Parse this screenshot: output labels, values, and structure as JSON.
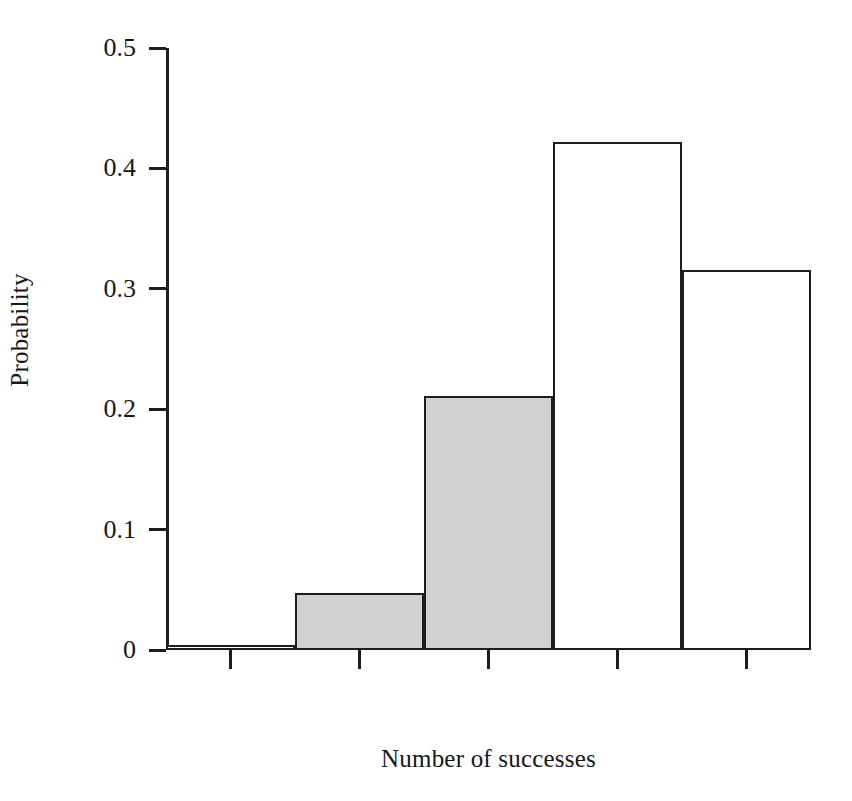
{
  "chart_data": {
    "type": "bar",
    "title": "",
    "subtitle": "",
    "xlabel": "Number of successes",
    "ylabel": "Probability",
    "categories": [
      "0",
      "1",
      "2",
      "3",
      "4"
    ],
    "values": [
      0.004,
      0.047,
      0.211,
      0.422,
      0.316
    ],
    "bar_fill": [
      "white",
      "shaded",
      "shaded",
      "white",
      "white"
    ],
    "xlim": [
      -0.5,
      4.5
    ],
    "ylim": [
      0,
      0.5
    ],
    "xticks": [
      "0",
      "1",
      "2",
      "3",
      "4"
    ],
    "yticks": [
      "0",
      "0.1",
      "0.2",
      "0.3",
      "0.4",
      "0.5"
    ],
    "ytick_values": [
      0,
      0.1,
      0.2,
      0.3,
      0.4,
      0.5
    ],
    "grid": false,
    "legend": null,
    "annotations": [],
    "colors": {
      "bar_shaded_fill": "#d2d2d2",
      "bar_unshaded_fill": "#ffffff",
      "bar_stroke": "#1d1d1d",
      "axis": "#1d1d1d",
      "text": "#171717",
      "background": "#ffffff"
    }
  },
  "axes": {
    "x_title": "Number of successes",
    "y_title": "Probability",
    "y_ticks": [
      {
        "label": "0.5",
        "value": 0.5
      },
      {
        "label": "0.4",
        "value": 0.4
      },
      {
        "label": "0.3",
        "value": 0.3
      },
      {
        "label": "0.2",
        "value": 0.2
      },
      {
        "label": "0.1",
        "value": 0.1
      },
      {
        "label": "0",
        "value": 0
      }
    ],
    "x_ticks": [
      {
        "label": "0",
        "value": 0
      },
      {
        "label": "1",
        "value": 1
      },
      {
        "label": "2",
        "value": 2
      },
      {
        "label": "3",
        "value": 3
      },
      {
        "label": "4",
        "value": 4
      }
    ]
  }
}
